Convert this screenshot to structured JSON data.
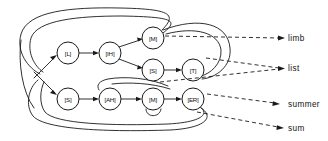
{
  "diagram": {
    "stroke_color": "#1a1a1a",
    "background_color": "#ffffff",
    "nodes": [
      {
        "id": "L",
        "label": "[L]",
        "cx": 68,
        "cy": 53,
        "r": 11
      },
      {
        "id": "IH",
        "label": "[IH]",
        "cx": 110,
        "cy": 53,
        "r": 11
      },
      {
        "id": "M1",
        "label": "[M]",
        "cx": 153,
        "cy": 38,
        "r": 11
      },
      {
        "id": "S2",
        "label": "[S]",
        "cx": 153,
        "cy": 70,
        "r": 11
      },
      {
        "id": "T",
        "label": "[T]",
        "cx": 193,
        "cy": 70,
        "r": 11
      },
      {
        "id": "S1",
        "label": "[S]",
        "cx": 68,
        "cy": 99,
        "r": 11
      },
      {
        "id": "AH",
        "label": "[AH]",
        "cx": 110,
        "cy": 99,
        "r": 11
      },
      {
        "id": "M2",
        "label": "[M]",
        "cx": 153,
        "cy": 99,
        "r": 11
      },
      {
        "id": "ER",
        "label": "[ER]",
        "cx": 193,
        "cy": 99,
        "r": 11
      }
    ],
    "outputs": [
      {
        "id": "limb",
        "label": "limb",
        "x": 288,
        "y": 37
      },
      {
        "id": "list",
        "label": "list",
        "x": 288,
        "y": 68
      },
      {
        "id": "summer",
        "label": "summer",
        "x": 288,
        "y": 101
      },
      {
        "id": "sum",
        "label": "sum",
        "x": 288,
        "y": 127
      }
    ],
    "edges": [
      {
        "from": "start",
        "to": "L",
        "type": "solid"
      },
      {
        "from": "start",
        "to": "S1",
        "type": "solid"
      },
      {
        "from": "L",
        "to": "IH",
        "type": "solid"
      },
      {
        "from": "IH",
        "to": "M1",
        "type": "solid"
      },
      {
        "from": "IH",
        "to": "S2",
        "type": "solid"
      },
      {
        "from": "S2",
        "to": "T",
        "type": "solid"
      },
      {
        "from": "S1",
        "to": "AH",
        "type": "solid"
      },
      {
        "from": "AH",
        "to": "M2",
        "type": "solid"
      },
      {
        "from": "M2",
        "to": "ER",
        "type": "solid"
      },
      {
        "from": "M1",
        "to": "start",
        "type": "loopback"
      },
      {
        "from": "T",
        "to": "start",
        "type": "loopback"
      },
      {
        "from": "M2",
        "to": "AH",
        "type": "loopback"
      },
      {
        "from": "ER",
        "to": "start",
        "type": "loopback"
      },
      {
        "from": "ER",
        "to": "start",
        "type": "loopback"
      },
      {
        "from": "M1",
        "to": "limb",
        "type": "dashed"
      },
      {
        "from": "T",
        "to": "list",
        "type": "dashed"
      },
      {
        "from": "ER",
        "to": "list",
        "type": "dashed"
      },
      {
        "from": "ER",
        "to": "summer",
        "type": "dashed"
      },
      {
        "from": "ER",
        "to": "sum",
        "type": "dashed"
      }
    ]
  }
}
